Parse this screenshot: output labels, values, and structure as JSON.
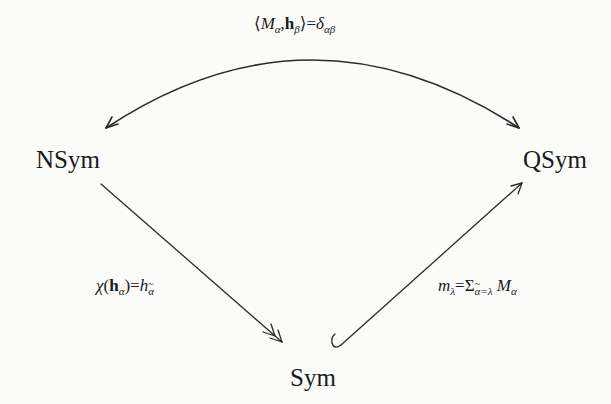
{
  "diagram": {
    "type": "commutative-diagram",
    "nodes": {
      "nsym": {
        "label": "NSym"
      },
      "qsym": {
        "label": "QSym"
      },
      "sym": {
        "label": "Sym"
      }
    },
    "edges": {
      "duality": {
        "from": "NSym",
        "to": "QSym",
        "style": "curved, bidirectional arrows",
        "label": "⟨Mα,hβ⟩=δαβ",
        "parts": {
          "langle": "⟨",
          "M": "M",
          "alpha_sub": "α",
          "comma": ",",
          "h": "h",
          "beta_sub": "β",
          "rangle_eq": "⟩=",
          "delta": "δ",
          "delta_sub": "αβ"
        }
      },
      "projection": {
        "from": "NSym",
        "to": "Sym",
        "style": "surjection (double arrowhead)",
        "label": "χ(hα)=hα̃",
        "parts": {
          "chi": "χ",
          "open": "(",
          "h": "h",
          "alpha_sub": "α",
          "close_eq": ")=",
          "h2": "h",
          "alpha_tilde_sub": "α"
        }
      },
      "inclusion": {
        "from": "Sym",
        "to": "QSym",
        "style": "injection (hooked tail)",
        "label": "mλ=Σα̃=λ Mα",
        "parts": {
          "m": "m",
          "lambda_sub": "λ",
          "eq": "=",
          "sigma": "Σ",
          "sum_alpha": "α",
          "sum_rest": "=λ",
          "M": "M",
          "alpha_sub": "α"
        }
      }
    },
    "colors": {
      "ink": "#1a1a1a",
      "stroke": "#2a2a2a",
      "paper": "#fbfbfa"
    }
  }
}
